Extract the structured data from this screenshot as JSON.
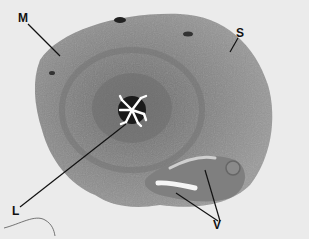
{
  "figure": {
    "labels": [
      {
        "id": "M",
        "text": "M"
      },
      {
        "id": "S",
        "text": "S"
      },
      {
        "id": "L",
        "text": "L"
      },
      {
        "id": "V",
        "text": "V"
      }
    ],
    "colors": {
      "background": "#ebebeb",
      "tissue_outer": "#8f8f8f",
      "tissue_inner": "#7a7a7a",
      "lumen": "#ffffff",
      "leader_lines": "#111111"
    }
  }
}
